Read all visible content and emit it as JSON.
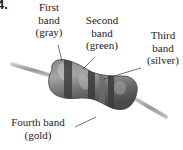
{
  "figure": {
    "number": "4.",
    "colors": {
      "body": "#6e6e6e",
      "body_highlight": "#a8a8a8",
      "band": "#3c3c3c",
      "lead": "#b8b8b8",
      "leader_line": "#333333"
    }
  },
  "labels": {
    "first": {
      "line1": "First",
      "line2": "band",
      "line3": "(gray)"
    },
    "second": {
      "line1": "Second",
      "line2": "band",
      "line3": "(green)"
    },
    "third": {
      "line1": "Third",
      "line2": "band",
      "line3": "(silver)"
    },
    "fourth": {
      "line1": "Fourth band",
      "line2": "(gold)"
    }
  }
}
